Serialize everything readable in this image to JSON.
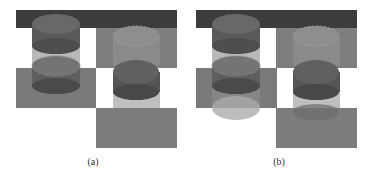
{
  "figure": {
    "panels": [
      {
        "id": "a",
        "caption": "(a)",
        "description": "Rendered scene of stacked cylinders over checkerboard (shadows faint)"
      },
      {
        "id": "b",
        "caption": "(b)",
        "description": "Rendered scene of stacked cylinders over checkerboard (visible translucent ghost cylinders below)"
      }
    ]
  },
  "colors": {
    "background": "#ffffff",
    "top_bar": "#3c3c3c",
    "gray_tile": "#7a7a7a",
    "cylinder_dark": "#555555",
    "cylinder_mid": "#6e6e6e",
    "cylinder_light": "#8c8c8c",
    "ghost": "#bdbdbd"
  }
}
